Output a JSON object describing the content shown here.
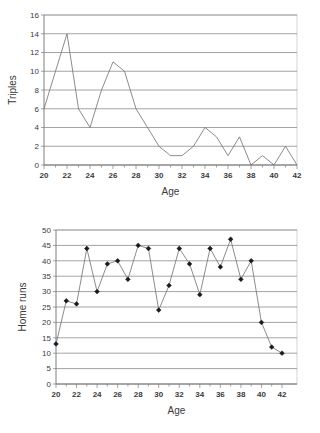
{
  "chart_data": [
    {
      "type": "line",
      "name": "triples-by-age",
      "title": "",
      "xlabel": "Age",
      "ylabel": "Triples",
      "xlim": [
        20,
        42
      ],
      "ylim": [
        0,
        16
      ],
      "ytick_step": 2,
      "xtick_step": 2,
      "yticks": [
        0,
        2,
        4,
        6,
        8,
        10,
        12,
        14,
        16
      ],
      "xticks": [
        20,
        22,
        24,
        26,
        28,
        30,
        32,
        34,
        36,
        38,
        40,
        42
      ],
      "grid": "horizontal",
      "legend": "none",
      "markers": false,
      "line_color": "#6f6f6f",
      "x": [
        20,
        21,
        22,
        23,
        24,
        25,
        26,
        27,
        28,
        29,
        30,
        31,
        32,
        33,
        34,
        35,
        36,
        37,
        38,
        39,
        40,
        41,
        42
      ],
      "values": [
        6,
        10,
        14,
        6,
        4,
        8,
        11,
        10,
        6,
        4,
        2,
        1,
        1,
        2,
        4,
        3,
        1,
        3,
        0,
        1,
        0,
        2,
        0
      ]
    },
    {
      "type": "line",
      "name": "home-runs-by-age",
      "title": "",
      "xlabel": "Age",
      "ylabel": "Home runs",
      "xlim": [
        20,
        42
      ],
      "ylim": [
        0,
        50
      ],
      "ytick_step": 5,
      "xtick_step": 2,
      "yticks": [
        0,
        5,
        10,
        15,
        20,
        25,
        30,
        35,
        40,
        45,
        50
      ],
      "xticks": [
        20,
        22,
        24,
        26,
        28,
        30,
        32,
        34,
        36,
        38,
        40,
        42
      ],
      "grid": "horizontal",
      "legend": "none",
      "markers": true,
      "marker_shape": "diamond",
      "marker_color": "#1a1a1a",
      "line_color": "#6f6f6f",
      "x": [
        20,
        21,
        22,
        23,
        24,
        25,
        26,
        27,
        28,
        29,
        30,
        31,
        32,
        33,
        34,
        35,
        36,
        37,
        38,
        39,
        40,
        41,
        42
      ],
      "values": [
        13,
        27,
        26,
        44,
        30,
        39,
        40,
        34,
        45,
        44,
        24,
        32,
        44,
        39,
        29,
        44,
        38,
        47,
        34,
        40,
        20,
        12,
        10
      ]
    }
  ]
}
